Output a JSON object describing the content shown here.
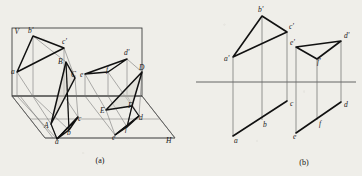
{
  "figure": {
    "background_color": "#efeee9",
    "ink_color": "#161616",
    "thin_ink_color": "#5d5d5d",
    "captions": [
      {
        "id": "caption-a",
        "text": "(a)",
        "x": 100,
        "y": 163
      },
      {
        "id": "caption-b",
        "text": "(b)",
        "x": 304,
        "y": 165
      }
    ]
  },
  "panel_a": {
    "name": "pictorial-view",
    "plane_labels": [
      {
        "id": "plane-v",
        "text": "V",
        "x": 14.5,
        "y": 34
      },
      {
        "id": "plane-h",
        "text": "H",
        "x": 166,
        "y": 143
      }
    ],
    "v_plane_rect": {
      "x1": 12,
      "y1": 28,
      "x2": 142,
      "y2": 96
    },
    "h_plane_poly": "12,96 142,96 175,138 45,138",
    "triangle1": {
      "vertices_v": [
        {
          "id": "a-prime",
          "text": "a",
          "x": 11,
          "y": 74,
          "px": 17,
          "py": 72
        },
        {
          "id": "b-prime",
          "text": "b'",
          "x": 28,
          "y": 33,
          "px": 33,
          "py": 36
        },
        {
          "id": "c-prime",
          "text": "c'",
          "x": 62,
          "y": 44,
          "px": 64,
          "py": 48
        }
      ],
      "vertices_space": [
        {
          "id": "A",
          "text": "A",
          "x": 44,
          "y": 128,
          "px": 51,
          "py": 124
        },
        {
          "id": "B",
          "text": "B",
          "x": 58,
          "y": 64,
          "px": 66,
          "py": 62
        },
        {
          "id": "C",
          "text": "C",
          "x": 71,
          "y": 77,
          "px": 75,
          "py": 78
        }
      ],
      "vertices_h": [
        {
          "id": "a",
          "text": "a",
          "x": 55,
          "y": 144,
          "px": 57,
          "py": 139
        },
        {
          "id": "b",
          "text": "b",
          "x": 67,
          "y": 135,
          "px": 69,
          "py": 130
        },
        {
          "id": "c",
          "text": "c",
          "x": 78,
          "y": 121,
          "px": 78,
          "py": 117
        }
      ]
    },
    "triangle2": {
      "vertices_v": [
        {
          "id": "e-prime",
          "text": "e",
          "x": 80,
          "y": 77,
          "px": 85,
          "py": 74
        },
        {
          "id": "d-prime",
          "text": "d'",
          "x": 124,
          "y": 55,
          "px": 127,
          "py": 59
        },
        {
          "id": "f-prime",
          "text": "f",
          "x": 106,
          "y": 72,
          "px": 108,
          "py": 72
        }
      ],
      "vertices_space": [
        {
          "id": "E",
          "text": "E",
          "x": 100,
          "y": 113,
          "px": 106,
          "py": 110
        },
        {
          "id": "D",
          "text": "D",
          "x": 139,
          "y": 70,
          "px": 142,
          "py": 72
        },
        {
          "id": "F",
          "text": "F",
          "x": 128,
          "y": 108,
          "px": 132,
          "py": 106
        }
      ],
      "vertices_h": [
        {
          "id": "e",
          "text": "e",
          "x": 112,
          "y": 140,
          "px": 115,
          "py": 135
        },
        {
          "id": "f",
          "text": "f",
          "x": 125,
          "y": 131,
          "px": 127,
          "py": 127
        },
        {
          "id": "d",
          "text": "d",
          "x": 139,
          "y": 120,
          "px": 139,
          "py": 116
        }
      ]
    }
  },
  "panel_b": {
    "name": "orthographic-view",
    "ground_line": {
      "x1": 196,
      "y1": 82,
      "x2": 356,
      "y2": 82
    },
    "triangle1": {
      "front": [
        {
          "id": "a-prime-b",
          "text": "a'",
          "x": 224,
          "y": 61,
          "px": 233,
          "py": 57
        },
        {
          "id": "b-prime-b",
          "text": "b'",
          "x": 258,
          "y": 12,
          "px": 262,
          "py": 16
        },
        {
          "id": "c-prime-b",
          "text": "c'",
          "x": 289,
          "y": 29,
          "px": 287,
          "py": 32
        }
      ],
      "top": [
        {
          "id": "a-b",
          "text": "a",
          "x": 234,
          "y": 143,
          "px": 233,
          "py": 136
        },
        {
          "id": "b-b",
          "text": "b",
          "x": 263,
          "y": 127,
          "px": 262,
          "py": 120
        },
        {
          "id": "c-b",
          "text": "c",
          "x": 290,
          "y": 106,
          "px": 287,
          "py": 101
        }
      ]
    },
    "triangle2": {
      "front": [
        {
          "id": "e-prime-b",
          "text": "e'",
          "x": 290,
          "y": 45,
          "px": 296,
          "py": 47
        },
        {
          "id": "d-prime-b",
          "text": "d'",
          "x": 344,
          "y": 38,
          "px": 341,
          "py": 41
        },
        {
          "id": "f-prime-b",
          "text": "f'",
          "x": 317,
          "y": 64,
          "px": 317,
          "py": 59
        }
      ],
      "top": [
        {
          "id": "e-b",
          "text": "e",
          "x": 293,
          "y": 139,
          "px": 296,
          "py": 133
        },
        {
          "id": "f-b",
          "text": "f",
          "x": 319,
          "y": 126,
          "px": 320,
          "py": 120
        },
        {
          "id": "d-b",
          "text": "d",
          "x": 344,
          "y": 107,
          "px": 341,
          "py": 102
        }
      ]
    }
  }
}
